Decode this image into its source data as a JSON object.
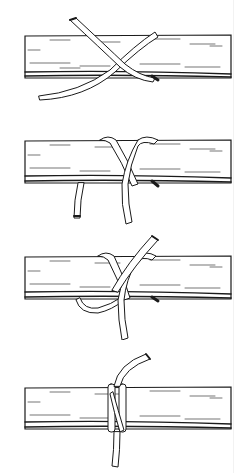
{
  "figure": {
    "panel_count": 4,
    "colors": {
      "ink": "#1a1a1a",
      "paper": "#ffffff",
      "rope_fill": "#ffffff"
    },
    "panels": [
      {
        "step": 1,
        "description": "rope end crosses over log forming an X",
        "log_top": 36,
        "log_bottom": 78
      },
      {
        "step": 2,
        "description": "rope wrapped once around log, working end hanging down left",
        "log_top": 141,
        "log_bottom": 183
      },
      {
        "step": 3,
        "description": "second wrap crossing over first, end pointing up",
        "log_top": 257,
        "log_bottom": 299
      },
      {
        "step": 4,
        "description": "finished clove hitch pulled tight",
        "log_top": 387,
        "log_bottom": 429
      }
    ]
  }
}
